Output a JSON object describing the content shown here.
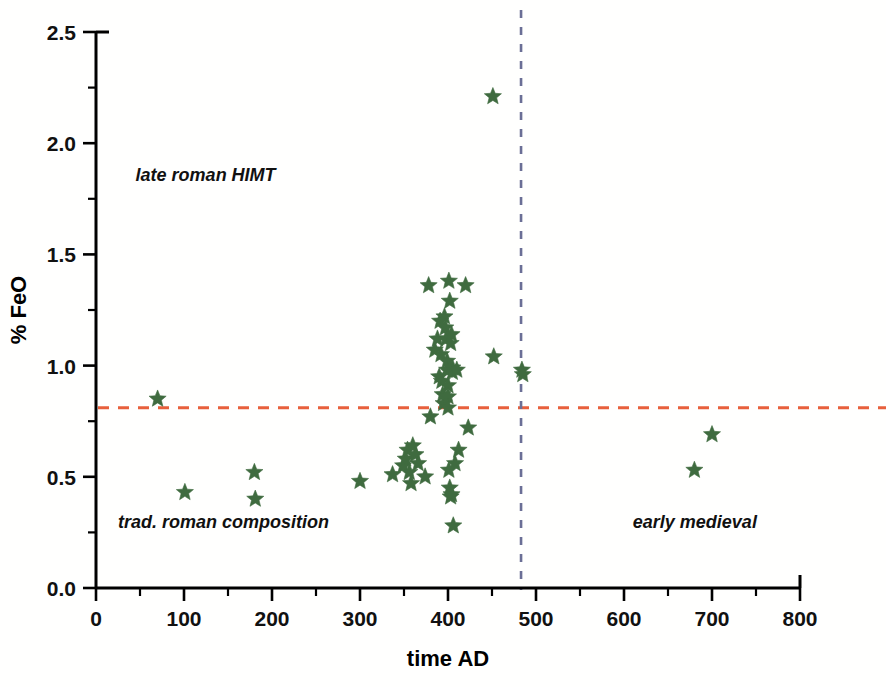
{
  "chart_data": {
    "type": "scatter",
    "title": "",
    "xlabel": "time  AD",
    "ylabel": "% FeO",
    "xlim": [
      0,
      800
    ],
    "ylim": [
      0.0,
      2.5
    ],
    "xticks": [
      0,
      100,
      200,
      300,
      400,
      500,
      600,
      700,
      800
    ],
    "xtick_labels": [
      "0",
      "100",
      "200",
      "300",
      "400",
      "500",
      "600",
      "700",
      "800"
    ],
    "yticks": [
      0.0,
      0.5,
      1.0,
      1.5,
      2.0,
      2.5
    ],
    "ytick_labels": [
      "0.0",
      "0.5",
      "1.0",
      "1.5",
      "2.0",
      "2.5"
    ],
    "x_minor_tick_step": 50,
    "y_minor_tick_step": 0.25,
    "grid": false,
    "legend": null,
    "marker": "star",
    "marker_color": "#3f6b3f",
    "marker_size": 15,
    "series": [
      {
        "name": "glass samples",
        "points": [
          [
            70,
            0.85
          ],
          [
            101,
            0.43
          ],
          [
            180,
            0.52
          ],
          [
            181,
            0.4
          ],
          [
            300,
            0.48
          ],
          [
            337,
            0.51
          ],
          [
            349,
            0.55
          ],
          [
            352,
            0.58
          ],
          [
            354,
            0.62
          ],
          [
            356,
            0.52
          ],
          [
            358,
            0.47
          ],
          [
            360,
            0.64
          ],
          [
            363,
            0.6
          ],
          [
            366,
            0.56
          ],
          [
            374,
            0.5
          ],
          [
            378,
            1.36
          ],
          [
            380,
            0.77
          ],
          [
            385,
            1.07
          ],
          [
            388,
            1.12
          ],
          [
            390,
            0.95
          ],
          [
            391,
            1.2
          ],
          [
            392,
            1.05
          ],
          [
            393,
            0.93
          ],
          [
            394,
            0.87
          ],
          [
            395,
            0.83
          ],
          [
            396,
            1.22
          ],
          [
            397,
            1.17
          ],
          [
            398,
            1.12
          ],
          [
            399,
            1.02
          ],
          [
            399,
            0.98
          ],
          [
            400,
            0.91
          ],
          [
            400,
            0.86
          ],
          [
            400,
            0.81
          ],
          [
            401,
            1.38
          ],
          [
            401,
            0.53
          ],
          [
            402,
            1.29
          ],
          [
            402,
            0.45
          ],
          [
            403,
            1.1
          ],
          [
            403,
            0.41
          ],
          [
            404,
            1.14
          ],
          [
            404,
            0.42
          ],
          [
            405,
            0.99
          ],
          [
            405,
            0.97
          ],
          [
            406,
            0.28
          ],
          [
            408,
            0.56
          ],
          [
            410,
            0.98
          ],
          [
            412,
            0.62
          ],
          [
            420,
            1.36
          ],
          [
            423,
            0.72
          ],
          [
            451,
            2.21
          ],
          [
            452,
            1.04
          ],
          [
            484,
            0.98
          ],
          [
            485,
            0.96
          ],
          [
            680,
            0.53
          ],
          [
            700,
            0.69
          ]
        ]
      }
    ],
    "reference_lines": [
      {
        "name": "feo-threshold",
        "orientation": "horizontal",
        "value": 0.81,
        "color": "#e8603c",
        "style": "dashed"
      },
      {
        "name": "era-boundary",
        "orientation": "vertical",
        "value": 483,
        "color": "#6b6f96",
        "style": "dashed"
      }
    ],
    "annotations": [
      {
        "name": "late-roman-himt",
        "text": "late roman HIMT",
        "x": 45,
        "y": 1.83
      },
      {
        "name": "trad-roman-composition",
        "text": "trad. roman composition",
        "x": 25,
        "y": 0.27
      },
      {
        "name": "early-medieval",
        "text": "early medieval",
        "x": 610,
        "y": 0.27
      }
    ]
  },
  "footer": {
    "cropped_text": ""
  }
}
